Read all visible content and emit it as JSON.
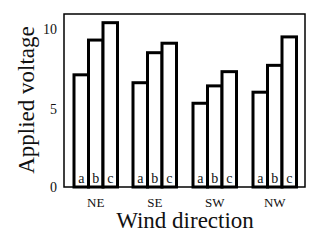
{
  "chart_data": {
    "type": "bar",
    "title": "",
    "xlabel": "Wind direction",
    "ylabel": "Applied voltage",
    "categories": [
      "NE",
      "SE",
      "SW",
      "NW"
    ],
    "series": [
      {
        "name": "a",
        "values": [
          7.1,
          6.6,
          5.3,
          6.0
        ]
      },
      {
        "name": "b",
        "values": [
          9.3,
          8.5,
          6.4,
          7.7
        ]
      },
      {
        "name": "c",
        "values": [
          10.4,
          9.1,
          7.3,
          9.5
        ]
      }
    ],
    "bar_labels": [
      "a",
      "b",
      "c"
    ],
    "yticks": [
      0,
      5,
      10
    ],
    "ylim": [
      0,
      10.9
    ],
    "grid": false,
    "legend": "none (bars labeled a, b, c inside at base)",
    "colors": {
      "bar_fill": "#ffffff",
      "bar_stroke": "#000000",
      "frame": "#000000"
    }
  },
  "labels": {
    "xlabel": "Wind direction",
    "ylabel": "Applied voltage",
    "ytick_0": "0",
    "ytick_5": "5",
    "ytick_10": "10"
  }
}
